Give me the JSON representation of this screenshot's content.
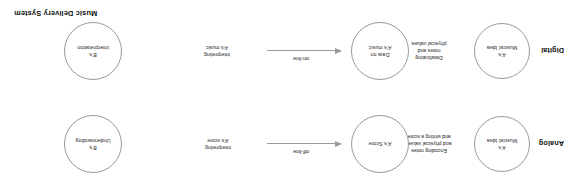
{
  "diagram": {
    "title": "Music Delivery System",
    "orientation": "rotated-180",
    "rows": [
      {
        "mode": "Analog",
        "nodes": [
          {
            "name": "node-musical-idea",
            "lines": [
              "A's",
              "Musical Idea"
            ]
          },
          {
            "name": "node-score",
            "lines": [
              "A's Score"
            ]
          },
          {
            "name": "node-understanding",
            "lines": [
              "B's",
              "Understanding"
            ]
          }
        ],
        "steps": [
          {
            "name": "step-encoding",
            "lines": [
              "Encoding notes",
              "and physical values",
              "and writing a score"
            ]
          },
          {
            "name": "step-interpreting",
            "lines": [
              "interpreting",
              "A's score"
            ]
          }
        ],
        "arrow": {
          "caption": "off-line",
          "direction": "right"
        }
      },
      {
        "mode": "Digital",
        "nodes": [
          {
            "name": "node-musical-idea",
            "lines": [
              "A's",
              "Musical Idea"
            ]
          },
          {
            "name": "node-data-on-music",
            "lines": [
              "Data on",
              "A's music"
            ]
          },
          {
            "name": "node-interpretation",
            "lines": [
              "B's",
              "interpretation"
            ]
          }
        ],
        "steps": [
          {
            "name": "step-dataficating",
            "lines": [
              "Dataficating",
              "notes and",
              "physical values"
            ]
          },
          {
            "name": "step-interpreting",
            "lines": [
              "interpreting",
              "A's music"
            ]
          }
        ],
        "arrow": {
          "caption": "on-line",
          "direction": "right"
        }
      }
    ],
    "colors": {
      "stroke": "#9a9a9a",
      "text": "#1f1f1f",
      "background": "#ffffff"
    }
  }
}
